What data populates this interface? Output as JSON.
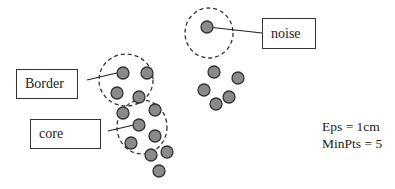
{
  "diagram": {
    "labels": {
      "border": "Border",
      "core": "core",
      "noise": "noise"
    },
    "parameters": {
      "eps": "Eps = 1cm",
      "minpts": "MinPts = 5"
    },
    "colors": {
      "point_fill": "#8a8a8a",
      "point_stroke": "#333333",
      "circle_stroke": "#333333",
      "box_stroke": "#333333",
      "text": "#222222"
    },
    "points": [
      {
        "x": 207,
        "y": 27,
        "type": "noise"
      },
      {
        "x": 214,
        "y": 72
      },
      {
        "x": 238,
        "y": 78
      },
      {
        "x": 204,
        "y": 90
      },
      {
        "x": 229,
        "y": 97
      },
      {
        "x": 216,
        "y": 104
      },
      {
        "x": 123,
        "y": 73,
        "type": "border"
      },
      {
        "x": 147,
        "y": 73
      },
      {
        "x": 117,
        "y": 93
      },
      {
        "x": 139,
        "y": 97
      },
      {
        "x": 123,
        "y": 113
      },
      {
        "x": 155,
        "y": 110
      },
      {
        "x": 139,
        "y": 125,
        "type": "core"
      },
      {
        "x": 155,
        "y": 136
      },
      {
        "x": 131,
        "y": 143
      },
      {
        "x": 151,
        "y": 155
      },
      {
        "x": 167,
        "y": 152
      },
      {
        "x": 159,
        "y": 171
      }
    ],
    "eps_circles": [
      {
        "name": "noise",
        "cx": 209,
        "cy": 33,
        "rx": 24,
        "ry": 25
      },
      {
        "name": "border",
        "cx": 126,
        "cy": 80,
        "rx": 27,
        "ry": 26
      },
      {
        "name": "core",
        "cx": 142,
        "cy": 127,
        "rx": 25,
        "ry": 27
      }
    ]
  }
}
